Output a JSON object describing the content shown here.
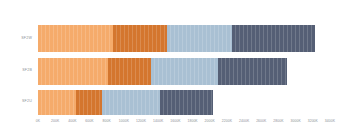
{
  "chart_data": {
    "type": "bar",
    "orientation": "horizontal",
    "stacked": true,
    "title": "",
    "subtitle": "",
    "xlabel": "",
    "ylabel": "",
    "grid": false,
    "legend_position": "none",
    "categories": [
      "SF2W",
      "SF2B",
      "SF2U"
    ],
    "series": [
      {
        "name": "Segment 1",
        "color": "#F5AB6B",
        "values": [
          870,
          820,
          440
        ]
      },
      {
        "name": "Segment 2",
        "color": "#D4762E",
        "values": [
          630,
          490,
          310
        ]
      },
      {
        "name": "Segment 3",
        "color": "#A9C0D3",
        "values": [
          760,
          790,
          670
        ]
      },
      {
        "name": "Segment 4",
        "color": "#555F75",
        "values": [
          970,
          800,
          620
        ]
      }
    ],
    "totals": [
      3230,
      2900,
      2040
    ],
    "xlim": [
      0,
      3400
    ],
    "xtick_step": 200,
    "xticks": [
      0,
      200,
      400,
      600,
      800,
      1000,
      1200,
      1400,
      1600,
      1800,
      2000,
      2200,
      2400,
      2600,
      2800,
      3000,
      3200,
      3400
    ],
    "xtick_labels": [
      "0K",
      "200K",
      "400K",
      "600K",
      "800K",
      "1000K",
      "1200K",
      "1400K",
      "1600K",
      "1800K",
      "2000K",
      "2200K",
      "2400K",
      "2600K",
      "2800K",
      "3000K",
      "3200K",
      "3400K"
    ],
    "colors": {
      "light_orange": "#F5AB6B",
      "dark_orange": "#D4762E",
      "light_blue": "#A9C0D3",
      "dark_slate": "#555F75",
      "background": "#FFFFFF",
      "tick_text": "#8B8F96"
    }
  }
}
